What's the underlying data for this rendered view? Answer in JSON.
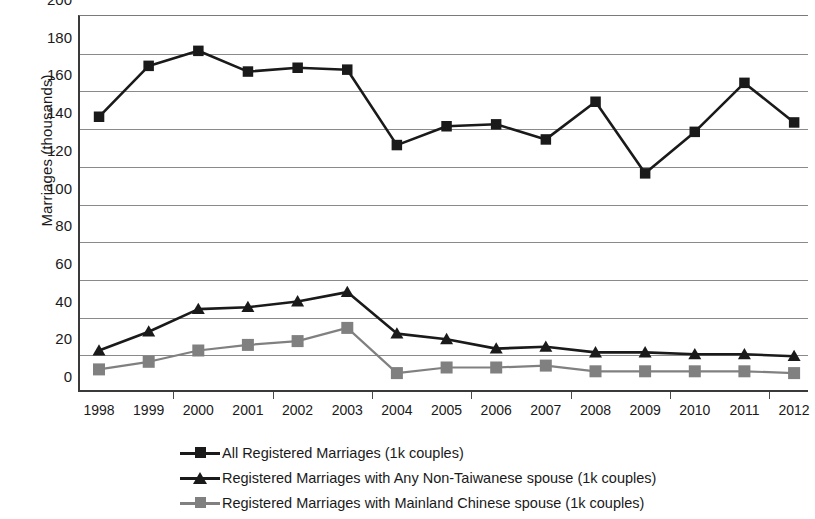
{
  "chart_data": {
    "type": "line",
    "title": "",
    "xlabel": "",
    "ylabel": "Marriages (thousands)",
    "categories": [
      "1998",
      "1999",
      "2000",
      "2001",
      "2002",
      "2003",
      "2004",
      "2005",
      "2006",
      "2007",
      "2008",
      "2009",
      "2010",
      "2011",
      "2012"
    ],
    "ylim": [
      0,
      200
    ],
    "yticks": [
      0,
      20,
      40,
      60,
      80,
      100,
      120,
      140,
      160,
      180,
      200
    ],
    "grid": true,
    "legend_position": "bottom",
    "series": [
      {
        "name": "All Registered Marriages (1k couples)",
        "marker": "square",
        "color": "#1a1a1a",
        "values": [
          146,
          173,
          181,
          170,
          172,
          171,
          131,
          141,
          142,
          134,
          154,
          116,
          138,
          164,
          143
        ]
      },
      {
        "name": "Registered Marriages with Any Non-Taiwanese spouse (1k couples)",
        "marker": "triangle",
        "color": "#1a1a1a",
        "values": [
          22,
          32,
          44,
          45,
          48,
          53,
          31,
          28,
          23,
          24,
          21,
          21,
          20,
          20,
          19
        ]
      },
      {
        "name": "Registered Marriages with Mainland Chinese spouse (1k couples)",
        "marker": "square",
        "color": "#808080",
        "values": [
          12,
          16,
          22,
          25,
          27,
          34,
          10,
          13,
          13,
          14,
          11,
          11,
          11,
          11,
          10
        ]
      }
    ]
  },
  "axes": {
    "y_title": "Marriages (thousands)",
    "y_labels": [
      "200",
      "180",
      "160",
      "140",
      "120",
      "100",
      "80",
      "60",
      "40",
      "20",
      "0"
    ],
    "x_labels": [
      "1998",
      "1999",
      "2000",
      "2001",
      "2002",
      "2003",
      "2004",
      "2005",
      "2006",
      "2007",
      "2008",
      "2009",
      "2010",
      "2011",
      "2012"
    ]
  },
  "legend": {
    "items": [
      {
        "label": "All Registered Marriages (1k couples)",
        "marker": "square-marker",
        "color": "#1a1a1a"
      },
      {
        "label": "Registered Marriages with Any Non-Taiwanese spouse (1k couples)",
        "marker": "triangle-marker",
        "color": "#1a1a1a"
      },
      {
        "label": "Registered Marriages with Mainland Chinese spouse (1k couples)",
        "marker": "square-marker",
        "color": "#808080"
      }
    ]
  }
}
